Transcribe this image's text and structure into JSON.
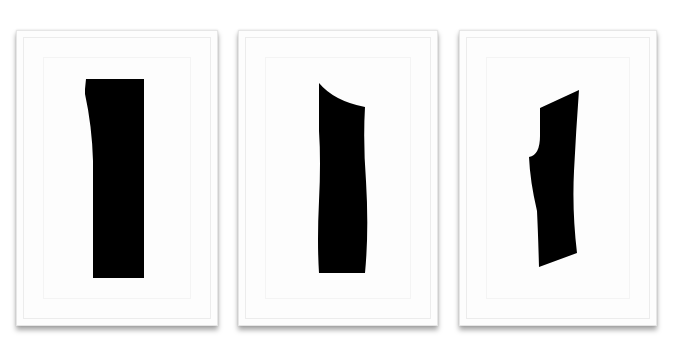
{
  "scene": {
    "description": "Three framed white panels on a white wall, each containing a black cut-out shape",
    "background_color": "#ffffff",
    "frame_color": "#fdfdfd",
    "shape_color": "#000000"
  },
  "frames": [
    {
      "id": 1,
      "shape": "vertical-rectangle-with-slight-left-curve",
      "x": 16,
      "y": 30,
      "width": 202,
      "height": 296
    },
    {
      "id": 2,
      "shape": "vertical-column-with-curved-top-left-cut",
      "x": 238,
      "y": 30,
      "width": 200,
      "height": 296
    },
    {
      "id": 3,
      "shape": "slanted-column-with-curved-left-notch",
      "x": 459,
      "y": 30,
      "width": 198,
      "height": 296
    }
  ]
}
